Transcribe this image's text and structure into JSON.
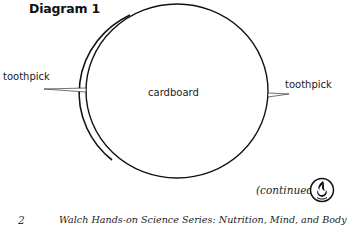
{
  "diagram": {
    "title": "Diagram 1",
    "labels": {
      "center": "cardboard",
      "left_toothpick": "toothpick",
      "right_toothpick": "toothpick"
    },
    "shapes": {
      "circle": "cardboard-circle",
      "left_pick": "toothpick-left",
      "right_pick": "toothpick-right"
    }
  },
  "page": {
    "continued": "(continued)",
    "logo_icon": "flame-logo-icon",
    "page_number": "2",
    "footer_text": "Walch Hands-on Science Series: Nutrition, Mind, and Body"
  }
}
